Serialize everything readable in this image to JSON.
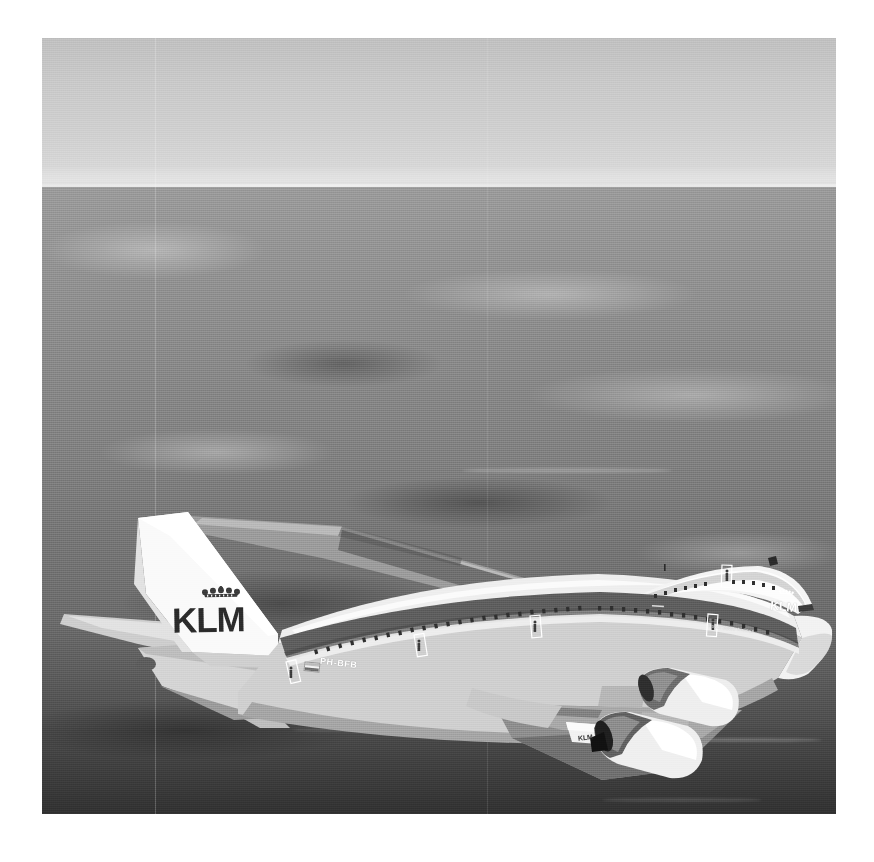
{
  "image": {
    "kind": "photograph",
    "rendering": "black-and-white",
    "subject": "KLM Boeing 747-400 airliner in flight, viewed from above and behind",
    "border_color": "#ffffff",
    "frame": {
      "x": 42,
      "y": 38,
      "width": 794,
      "height": 776
    }
  },
  "scene": {
    "sky_label": "hazy grey sky",
    "horizon_label": "horizon line",
    "ground_label": "hazy landscape far below",
    "horizon_y": 185,
    "sky_top_color": "#c0c0c0",
    "sky_bottom_color": "#dcdcdc",
    "ground_top_color": "#9a9a9a",
    "ground_bottom_color": "#303030"
  },
  "aircraft": {
    "operator": "KLM",
    "type_label": "Boeing 747-400",
    "registration": "PH-BFB",
    "tail_logo_text": "KLM",
    "nose_logo_text": "KLM",
    "winglet_text": "KLM",
    "fuselage_subtitle": "Royal Dutch Airlines",
    "crown_label": "KLM crown emblem",
    "flag_label": "Netherlands flag",
    "livery": {
      "fuselage_upper": "#e9e9e9",
      "fuselage_lower": "#cfcfcf",
      "cheatline": "#5f5f5f",
      "tail_fin": "#f7f7f7",
      "tail_text_color": "#2b2b2b",
      "engine_nacelle": "#ededed",
      "wing_upper": "#9f9f9f",
      "wing_shadow": "#4a4a4a"
    },
    "parts": [
      "vertical-stabilizer",
      "horizontal-stabilizer",
      "left-wing",
      "right-wing",
      "fuselage",
      "upper-deck",
      "engine-1",
      "engine-2",
      "winglet",
      "passenger-windows",
      "cabin-doors"
    ]
  }
}
